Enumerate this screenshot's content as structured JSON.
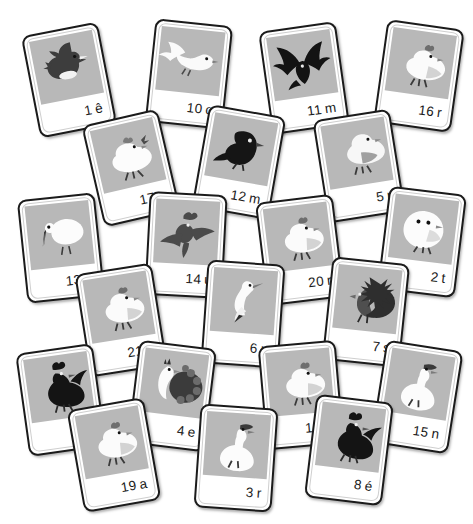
{
  "page": {
    "background_color": "#ffffff",
    "card_face_color": "#ffffff",
    "card_border_color": "#1b1b1b",
    "thumb_background_color": "#b8b8b8",
    "ink_color": "#1b1b1b",
    "card_count": 21
  },
  "cards": [
    {
      "id": "card-1",
      "number": "1",
      "letter": "ê",
      "caption": "1 ê",
      "subject": "duck",
      "tone": "dark",
      "x": 30,
      "y": 28,
      "rot": -11
    },
    {
      "id": "card-10",
      "number": "10",
      "letter": "o",
      "caption": "10 o",
      "subject": "dove",
      "tone": "light",
      "x": 150,
      "y": 22,
      "rot": 6
    },
    {
      "id": "card-11",
      "number": "11",
      "letter": "m",
      "caption": "11 m",
      "subject": "spread-wing-bird",
      "tone": "dark",
      "x": 265,
      "y": 26,
      "rot": -8
    },
    {
      "id": "card-16",
      "number": "16",
      "letter": "r",
      "caption": "16 r",
      "subject": "hen",
      "tone": "light",
      "x": 380,
      "y": 24,
      "rot": 8
    },
    {
      "id": "card-17",
      "number": "17",
      "letter": "e",
      "caption": "17 e",
      "subject": "chicken",
      "tone": "light",
      "x": 92,
      "y": 116,
      "rot": -13
    },
    {
      "id": "card-12",
      "number": "12",
      "letter": "m",
      "caption": "12 m",
      "subject": "blackbird",
      "tone": "dark",
      "x": 200,
      "y": 110,
      "rot": 10
    },
    {
      "id": "card-5",
      "number": "5",
      "letter": "r",
      "caption": "5 r",
      "subject": "pigeon",
      "tone": "mid",
      "x": 320,
      "y": 114,
      "rot": -9
    },
    {
      "id": "card-13",
      "number": "13",
      "letter": "e",
      "caption": "13 e",
      "subject": "stork",
      "tone": "light",
      "x": 22,
      "y": 196,
      "rot": -6
    },
    {
      "id": "card-14",
      "number": "14",
      "letter": "u",
      "caption": "14 u",
      "subject": "flying-bird",
      "tone": "dark",
      "x": 147,
      "y": 193,
      "rot": 3
    },
    {
      "id": "card-20",
      "number": "20",
      "letter": "r",
      "caption": "20 r",
      "subject": "hen",
      "tone": "light",
      "x": 261,
      "y": 198,
      "rot": -7
    },
    {
      "id": "card-2",
      "number": "2",
      "letter": "t",
      "caption": "2 t",
      "subject": "chick",
      "tone": "light",
      "x": 383,
      "y": 190,
      "rot": 7
    },
    {
      "id": "card-21",
      "number": "21",
      "letter": "d",
      "caption": "21 d",
      "subject": "hen",
      "tone": "light",
      "x": 82,
      "y": 268,
      "rot": -9
    },
    {
      "id": "card-6",
      "number": "6",
      "letter": "u",
      "caption": "6 u",
      "subject": "heron",
      "tone": "light",
      "x": 204,
      "y": 262,
      "rot": 4
    },
    {
      "id": "card-7",
      "number": "7",
      "letter": "s",
      "caption": "7 s",
      "subject": "turkey",
      "tone": "dark",
      "x": 327,
      "y": 260,
      "rot": 6
    },
    {
      "id": "card-9",
      "number": "9",
      "letter": "c",
      "caption": "9 c",
      "subject": "rooster",
      "tone": "dark",
      "x": 22,
      "y": 348,
      "rot": -8
    },
    {
      "id": "card-4",
      "number": "4",
      "letter": "e",
      "caption": "4 e",
      "subject": "peacock",
      "tone": "mid",
      "x": 133,
      "y": 344,
      "rot": 7
    },
    {
      "id": "card-18",
      "number": "18",
      "letter": "n",
      "caption": "18 n",
      "subject": "hen",
      "tone": "light",
      "x": 262,
      "y": 343,
      "rot": -5
    },
    {
      "id": "card-15",
      "number": "15",
      "letter": "n",
      "caption": "15 n",
      "subject": "goose",
      "tone": "light",
      "x": 378,
      "y": 345,
      "rot": 9
    },
    {
      "id": "card-19",
      "number": "19",
      "letter": "a",
      "caption": "19 a",
      "subject": "hen",
      "tone": "light",
      "x": 75,
      "y": 403,
      "rot": -10
    },
    {
      "id": "card-3",
      "number": "3",
      "letter": "r",
      "caption": "3 r",
      "subject": "goose",
      "tone": "light",
      "x": 197,
      "y": 406,
      "rot": 4
    },
    {
      "id": "card-8",
      "number": "8",
      "letter": "é",
      "caption": "8 é",
      "subject": "rooster",
      "tone": "dark",
      "x": 310,
      "y": 398,
      "rot": 7
    }
  ]
}
